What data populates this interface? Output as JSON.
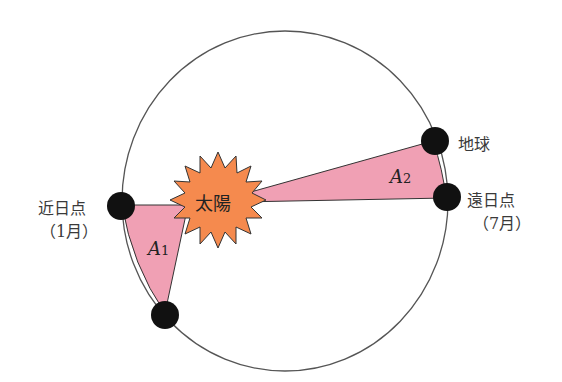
{
  "diagram": {
    "type": "kepler-second-law",
    "labels": {
      "sun": "太陽",
      "earth": "地球",
      "perihelion": "近日点",
      "perihelion_month": "（1月）",
      "aphelion": "遠日点",
      "aphelion_month": "（7月）",
      "area1_main": "A",
      "area1_sub": "1",
      "area2_main": "A",
      "area2_sub": "2"
    },
    "colors": {
      "orbit": "#555555",
      "area_fill": "#f0a0b4",
      "sun_fill": "#f58a4e",
      "planet": "#111111",
      "text": "#3a3a3a"
    }
  }
}
